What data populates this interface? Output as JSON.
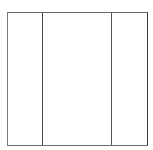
{
  "diagram": {
    "type": "three-column-layout",
    "panels": [
      {
        "id": "left",
        "label": ""
      },
      {
        "id": "center",
        "label": ""
      },
      {
        "id": "right",
        "label": ""
      }
    ],
    "colors": {
      "background": "#ffffff",
      "border": "#6b6b6b",
      "divider": "#454545"
    }
  }
}
